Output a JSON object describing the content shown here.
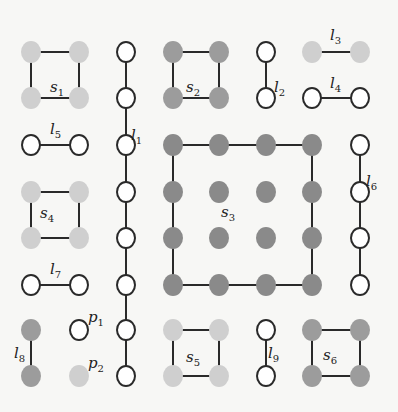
{
  "colors": {
    "background": "#f7f7f5",
    "edge": "#2a2a2a",
    "open_stroke": "#2a2a2a",
    "open_fill": "#ffffff",
    "light": "#cfcfcf",
    "mid": "#9c9c9c",
    "dark": "#8a8a8a"
  },
  "node_radius": {
    "rx": 10,
    "ry": 11
  },
  "groups": [
    {
      "id": "s1",
      "label": "s",
      "sub": "1",
      "label_pos": [
        50,
        92
      ],
      "fill": "light",
      "nodes": [
        [
          31,
          52
        ],
        [
          79,
          52
        ],
        [
          31,
          98
        ],
        [
          79,
          98
        ]
      ],
      "edges": [
        [
          0,
          1
        ],
        [
          0,
          2
        ],
        [
          1,
          3
        ],
        [
          2,
          3
        ]
      ]
    },
    {
      "id": "l1",
      "label": "l",
      "sub": "1",
      "label_pos": [
        131,
        140
      ],
      "fill": "open",
      "nodes": [
        [
          126,
          52
        ],
        [
          126,
          98
        ],
        [
          126,
          145
        ],
        [
          126,
          192
        ],
        [
          126,
          238
        ],
        [
          126,
          285
        ],
        [
          126,
          330
        ],
        [
          126,
          376
        ]
      ],
      "edges": [
        [
          0,
          1
        ],
        [
          1,
          2
        ],
        [
          2,
          3
        ],
        [
          3,
          4
        ],
        [
          4,
          5
        ],
        [
          5,
          6
        ],
        [
          6,
          7
        ]
      ]
    },
    {
      "id": "s2",
      "label": "s",
      "sub": "2",
      "label_pos": [
        186,
        92
      ],
      "fill": "mid",
      "nodes": [
        [
          173,
          52
        ],
        [
          219,
          52
        ],
        [
          173,
          98
        ],
        [
          219,
          98
        ]
      ],
      "edges": [
        [
          0,
          1
        ],
        [
          0,
          2
        ],
        [
          1,
          3
        ],
        [
          2,
          3
        ]
      ]
    },
    {
      "id": "l2",
      "label": "l",
      "sub": "2",
      "label_pos": [
        274,
        92
      ],
      "fill": "open",
      "nodes": [
        [
          266,
          52
        ],
        [
          266,
          98
        ]
      ],
      "edges": [
        [
          0,
          1
        ]
      ]
    },
    {
      "id": "l3",
      "label": "l",
      "sub": "3",
      "label_pos": [
        330,
        40
      ],
      "fill": "light",
      "nodes": [
        [
          312,
          52
        ],
        [
          360,
          52
        ]
      ],
      "edges": [
        [
          0,
          1
        ]
      ]
    },
    {
      "id": "l4",
      "label": "l",
      "sub": "4",
      "label_pos": [
        330,
        88
      ],
      "fill": "open",
      "nodes": [
        [
          312,
          98
        ],
        [
          360,
          98
        ]
      ],
      "edges": [
        [
          0,
          1
        ]
      ]
    },
    {
      "id": "l5",
      "label": "l",
      "sub": "5",
      "label_pos": [
        50,
        134
      ],
      "fill": "open",
      "nodes": [
        [
          31,
          145
        ],
        [
          79,
          145
        ]
      ],
      "edges": [
        [
          0,
          1
        ]
      ]
    },
    {
      "id": "s3",
      "label": "s",
      "sub": "3",
      "label_pos": [
        221,
        217
      ],
      "fill": "dark",
      "nodes": [
        [
          173,
          145
        ],
        [
          219,
          145
        ],
        [
          266,
          145
        ],
        [
          312,
          145
        ],
        [
          173,
          192
        ],
        [
          219,
          192
        ],
        [
          266,
          192
        ],
        [
          312,
          192
        ],
        [
          173,
          238
        ],
        [
          219,
          238
        ],
        [
          266,
          238
        ],
        [
          312,
          238
        ],
        [
          173,
          285
        ],
        [
          219,
          285
        ],
        [
          266,
          285
        ],
        [
          312,
          285
        ]
      ],
      "edges": [
        [
          0,
          1
        ],
        [
          1,
          2
        ],
        [
          2,
          3
        ],
        [
          0,
          4
        ],
        [
          4,
          8
        ],
        [
          8,
          12
        ],
        [
          12,
          13
        ],
        [
          13,
          14
        ],
        [
          14,
          15
        ],
        [
          3,
          7
        ],
        [
          7,
          11
        ],
        [
          11,
          15
        ]
      ]
    },
    {
      "id": "l6",
      "label": "l",
      "sub": "6",
      "label_pos": [
        366,
        186
      ],
      "fill": "open",
      "nodes": [
        [
          360,
          145
        ],
        [
          360,
          192
        ],
        [
          360,
          238
        ],
        [
          360,
          285
        ]
      ],
      "edges": [
        [
          0,
          1
        ],
        [
          1,
          2
        ],
        [
          2,
          3
        ]
      ]
    },
    {
      "id": "s4",
      "label": "s",
      "sub": "4",
      "label_pos": [
        40,
        218
      ],
      "fill": "light",
      "nodes": [
        [
          31,
          192
        ],
        [
          79,
          192
        ],
        [
          31,
          238
        ],
        [
          79,
          238
        ]
      ],
      "edges": [
        [
          0,
          1
        ],
        [
          0,
          2
        ],
        [
          1,
          3
        ],
        [
          2,
          3
        ]
      ]
    },
    {
      "id": "l7",
      "label": "l",
      "sub": "7",
      "label_pos": [
        50,
        274
      ],
      "fill": "open",
      "nodes": [
        [
          31,
          285
        ],
        [
          79,
          285
        ]
      ],
      "edges": [
        [
          0,
          1
        ]
      ]
    },
    {
      "id": "l8",
      "label": "l",
      "sub": "8",
      "label_pos": [
        14,
        358
      ],
      "fill": "mid",
      "nodes": [
        [
          31,
          330
        ],
        [
          31,
          376
        ]
      ],
      "edges": [
        [
          0,
          1
        ]
      ]
    },
    {
      "id": "p1",
      "label": "p",
      "sub": "1",
      "label_pos": [
        88,
        322
      ],
      "fill": "open",
      "nodes": [
        [
          79,
          330
        ]
      ],
      "edges": []
    },
    {
      "id": "p2",
      "label": "p",
      "sub": "2",
      "label_pos": [
        88,
        368
      ],
      "fill": "light",
      "nodes": [
        [
          79,
          376
        ]
      ],
      "edges": []
    },
    {
      "id": "s5",
      "label": "s",
      "sub": "5",
      "label_pos": [
        186,
        362
      ],
      "fill": "light",
      "nodes": [
        [
          173,
          330
        ],
        [
          219,
          330
        ],
        [
          173,
          376
        ],
        [
          219,
          376
        ]
      ],
      "edges": [
        [
          0,
          1
        ],
        [
          0,
          2
        ],
        [
          1,
          3
        ],
        [
          2,
          3
        ]
      ]
    },
    {
      "id": "l9",
      "label": "l",
      "sub": "9",
      "label_pos": [
        268,
        358
      ],
      "fill": "open",
      "nodes": [
        [
          266,
          330
        ],
        [
          266,
          376
        ]
      ],
      "edges": [
        [
          0,
          1
        ]
      ]
    },
    {
      "id": "s6",
      "label": "s",
      "sub": "6",
      "label_pos": [
        323,
        360
      ],
      "fill": "mid",
      "nodes": [
        [
          312,
          330
        ],
        [
          360,
          330
        ],
        [
          312,
          376
        ],
        [
          360,
          376
        ]
      ],
      "edges": [
        [
          0,
          1
        ],
        [
          0,
          2
        ],
        [
          1,
          3
        ],
        [
          2,
          3
        ]
      ]
    }
  ]
}
